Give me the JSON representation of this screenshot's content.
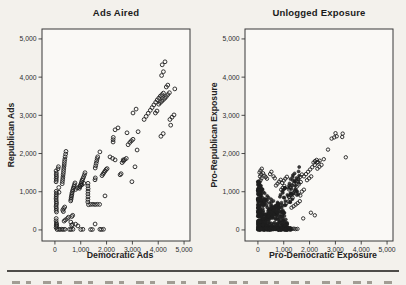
{
  "page": {
    "background": "#f3f1ec"
  },
  "chart_data": [
    {
      "type": "scatter",
      "title": "Ads Aired",
      "xlabel": "Democratic Ads",
      "ylabel": "Republican Ads",
      "xlim": [
        -500,
        5230
      ],
      "ylim": [
        -290,
        5260
      ],
      "xticks": {
        "values": [
          0,
          1000,
          2000,
          3000,
          4000,
          5000
        ],
        "labels": [
          "0",
          "1,000",
          "2,000",
          "3,000",
          "4,000",
          "5,000"
        ]
      },
      "yticks": {
        "values": [
          0,
          1000,
          2000,
          3000,
          4000,
          5000
        ],
        "labels": [
          "0",
          "1,000",
          "2,000",
          "3,000",
          "4,000",
          "5,000"
        ]
      },
      "grid": false,
      "legend": null,
      "point_color": "#1f1f1f",
      "frame_color": "#383838",
      "points": [
        [
          45,
          60
        ],
        [
          52,
          120
        ],
        [
          58,
          180
        ],
        [
          46,
          240
        ],
        [
          50,
          300
        ],
        [
          60,
          470
        ],
        [
          50,
          515
        ],
        [
          56,
          560
        ],
        [
          46,
          605
        ],
        [
          50,
          650
        ],
        [
          60,
          695
        ],
        [
          55,
          740
        ],
        [
          50,
          785
        ],
        [
          46,
          830
        ],
        [
          55,
          875
        ],
        [
          50,
          920
        ],
        [
          60,
          965
        ],
        [
          50,
          1010
        ],
        [
          46,
          1260
        ],
        [
          55,
          1305
        ],
        [
          50,
          1350
        ],
        [
          60,
          1395
        ],
        [
          50,
          1440
        ],
        [
          56,
          1485
        ],
        [
          46,
          1545
        ],
        [
          70,
          95
        ],
        [
          65,
          145
        ],
        [
          120,
          1600
        ],
        [
          135,
          1655
        ],
        [
          150,
          1110
        ],
        [
          160,
          985
        ],
        [
          85,
          10
        ],
        [
          145,
          16
        ],
        [
          205,
          10
        ],
        [
          265,
          20
        ],
        [
          325,
          12
        ],
        [
          385,
          16
        ],
        [
          355,
          230
        ],
        [
          405,
          262
        ],
        [
          485,
          300
        ],
        [
          525,
          332
        ],
        [
          645,
          120
        ],
        [
          685,
          142
        ],
        [
          890,
          105
        ],
        [
          300,
          520
        ],
        [
          340,
          560
        ],
        [
          380,
          600
        ],
        [
          330,
          480
        ],
        [
          282,
          1210
        ],
        [
          291,
          1268
        ],
        [
          300,
          1326
        ],
        [
          309,
          1384
        ],
        [
          318,
          1442
        ],
        [
          327,
          1500
        ],
        [
          336,
          1558
        ],
        [
          345,
          1616
        ],
        [
          354,
          1674
        ],
        [
          363,
          1732
        ],
        [
          372,
          1790
        ],
        [
          381,
          1848
        ],
        [
          395,
          1915
        ],
        [
          412,
          1985
        ],
        [
          428,
          2055
        ],
        [
          612,
          760
        ],
        [
          622,
          802
        ],
        [
          632,
          844
        ],
        [
          642,
          886
        ],
        [
          652,
          928
        ],
        [
          663,
          970
        ],
        [
          680,
          1012
        ],
        [
          698,
          1054
        ],
        [
          716,
          1096
        ],
        [
          734,
          1138
        ],
        [
          755,
          1185
        ],
        [
          778,
          1232
        ],
        [
          652,
          352
        ],
        [
          690,
          382
        ],
        [
          615,
          205
        ],
        [
          562,
          14
        ],
        [
          622,
          10
        ],
        [
          702,
          15
        ],
        [
          952,
          1090
        ],
        [
          972,
          1132
        ],
        [
          992,
          1174
        ],
        [
          1012,
          1216
        ],
        [
          1032,
          1258
        ],
        [
          1052,
          1300
        ],
        [
          1082,
          1342
        ],
        [
          1112,
          1388
        ],
        [
          1142,
          1442
        ],
        [
          1165,
          1498
        ],
        [
          1002,
          12
        ],
        [
          1082,
          15
        ],
        [
          800,
          1060
        ],
        [
          880,
          1100
        ],
        [
          960,
          1140
        ],
        [
          1040,
          1180
        ],
        [
          1120,
          1220
        ],
        [
          1272,
          730
        ],
        [
          1278,
          800
        ],
        [
          1282,
          870
        ],
        [
          1276,
          940
        ],
        [
          1280,
          1010
        ],
        [
          1284,
          1080
        ],
        [
          1278,
          1150
        ],
        [
          1282,
          1220
        ],
        [
          1300,
          660
        ],
        [
          1385,
          668
        ],
        [
          1470,
          672
        ],
        [
          1555,
          666
        ],
        [
          1640,
          670
        ],
        [
          1730,
          668
        ],
        [
          1940,
          890
        ],
        [
          1382,
          12
        ],
        [
          1452,
          10
        ],
        [
          1742,
          16
        ],
        [
          1802,
          10
        ],
        [
          1882,
          16
        ],
        [
          800,
          150
        ],
        [
          1555,
          155
        ],
        [
          1552,
          1312
        ],
        [
          1565,
          1362
        ],
        [
          1558,
          1620
        ],
        [
          1578,
          1682
        ],
        [
          1598,
          1744
        ],
        [
          1618,
          1806
        ],
        [
          1638,
          1868
        ],
        [
          1658,
          1915
        ],
        [
          1822,
          1422
        ],
        [
          1862,
          1462
        ],
        [
          1902,
          1502
        ],
        [
          1942,
          1542
        ],
        [
          1982,
          1582
        ],
        [
          2022,
          1605
        ],
        [
          1742,
          2042
        ],
        [
          2132,
          1912
        ],
        [
          2232,
          1872
        ],
        [
          2332,
          1832
        ],
        [
          2602,
          1762
        ],
        [
          2652,
          1802
        ],
        [
          2702,
          1842
        ],
        [
          2762,
          1872
        ],
        [
          2642,
          1832
        ],
        [
          2522,
          1442
        ],
        [
          2562,
          1472
        ],
        [
          3102,
          1652
        ],
        [
          2982,
          1262
        ],
        [
          2252,
          2302
        ],
        [
          2252,
          2362
        ],
        [
          2262,
          2422
        ],
        [
          2332,
          2622
        ],
        [
          2442,
          2672
        ],
        [
          2792,
          2542
        ],
        [
          3222,
          2572
        ],
        [
          2832,
          2232
        ],
        [
          3182,
          2092
        ],
        [
          2902,
          2292
        ],
        [
          2962,
          2332
        ],
        [
          3022,
          2372
        ],
        [
          3022,
          3062
        ],
        [
          3142,
          3162
        ],
        [
          3452,
          2892
        ],
        [
          3532,
          2972
        ],
        [
          3612,
          3052
        ],
        [
          3692,
          3132
        ],
        [
          3762,
          3202
        ],
        [
          3832,
          3272
        ],
        [
          3902,
          3342
        ],
        [
          3962,
          3402
        ],
        [
          4022,
          3452
        ],
        [
          4082,
          3502
        ],
        [
          4142,
          3542
        ],
        [
          4202,
          3582
        ],
        [
          4022,
          3292
        ],
        [
          4082,
          3332
        ],
        [
          4142,
          3372
        ],
        [
          4202,
          3412
        ],
        [
          4262,
          3452
        ],
        [
          3892,
          3062
        ],
        [
          3952,
          3112
        ],
        [
          4312,
          3492
        ],
        [
          4372,
          3542
        ],
        [
          4432,
          3592
        ],
        [
          4312,
          3742
        ],
        [
          4372,
          3792
        ],
        [
          4132,
          4042
        ],
        [
          4642,
          3692
        ],
        [
          4452,
          2892
        ],
        [
          4532,
          2952
        ],
        [
          4612,
          3012
        ],
        [
          4102,
          2452
        ],
        [
          4192,
          2522
        ],
        [
          4482,
          2742
        ],
        [
          4152,
          4322
        ],
        [
          4262,
          4402
        ],
        [
          4202,
          4142
        ]
      ],
      "dense_regions": []
    },
    {
      "type": "scatter",
      "title": "Unlogged Exposure",
      "xlabel": "Pro-Democratic Exposure",
      "ylabel": "Pro-Republican Exposure",
      "xlim": [
        -500,
        5230
      ],
      "ylim": [
        -290,
        5260
      ],
      "xticks": {
        "values": [
          0,
          1000,
          2000,
          3000,
          4000,
          5000
        ],
        "labels": [
          "0",
          "1,000",
          "2,000",
          "3,000",
          "4,000",
          "5,000"
        ]
      },
      "yticks": {
        "values": [
          0,
          1000,
          2000,
          3000,
          4000,
          5000
        ],
        "labels": [
          "0",
          "1,000",
          "2,000",
          "3,000",
          "4,000",
          "5,000"
        ]
      },
      "grid": false,
      "legend": null,
      "point_color": "#1f1f1f",
      "frame_color": "#383838",
      "points": [
        [
          60,
          1250
        ],
        [
          100,
          1300
        ],
        [
          140,
          1352
        ],
        [
          82,
          1402
        ],
        [
          122,
          1452
        ],
        [
          62,
          1502
        ],
        [
          102,
          1552
        ],
        [
          152,
          1602
        ],
        [
          202,
          1482
        ],
        [
          252,
          1422
        ],
        [
          302,
          1382
        ],
        [
          352,
          1342
        ],
        [
          472,
          1462
        ],
        [
          522,
          1522
        ],
        [
          602,
          1402
        ],
        [
          652,
          1352
        ],
        [
          702,
          1162
        ],
        [
          762,
          1212
        ],
        [
          822,
          1262
        ],
        [
          882,
          1312
        ],
        [
          942,
          1232
        ],
        [
          1002,
          1292
        ],
        [
          1062,
          1342
        ],
        [
          1122,
          1392
        ],
        [
          902,
          1052
        ],
        [
          962,
          1102
        ],
        [
          1022,
          1152
        ],
        [
          1202,
          1062
        ],
        [
          1262,
          1112
        ],
        [
          1322,
          1162
        ],
        [
          1402,
          1212
        ],
        [
          1482,
          1272
        ],
        [
          1562,
          1332
        ],
        [
          1642,
          1392
        ],
        [
          1702,
          1452
        ],
        [
          1782,
          1402
        ],
        [
          1862,
          1462
        ],
        [
          1942,
          1522
        ],
        [
          2022,
          1582
        ],
        [
          2102,
          1642
        ],
        [
          1502,
          1132
        ],
        [
          1582,
          1192
        ],
        [
          1662,
          1252
        ],
        [
          1202,
          862
        ],
        [
          1282,
          912
        ],
        [
          1362,
          962
        ],
        [
          1442,
          1012
        ],
        [
          2202,
          1702
        ],
        [
          2282,
          1762
        ],
        [
          2152,
          1762
        ],
        [
          2212,
          1802
        ],
        [
          2272,
          1832
        ],
        [
          2332,
          1772
        ],
        [
          2392,
          1812
        ],
        [
          2552,
          1852
        ],
        [
          2712,
          2102
        ],
        [
          2852,
          2392
        ],
        [
          2952,
          2422
        ],
        [
          3052,
          2452
        ],
        [
          3002,
          2532
        ],
        [
          3402,
          1902
        ],
        [
          3262,
          2432
        ],
        [
          3282,
          2522
        ],
        [
          2302,
          1602
        ],
        [
          2382,
          1652
        ],
        [
          2462,
          1702
        ],
        [
          1902,
          1302
        ],
        [
          1982,
          1352
        ],
        [
          2062,
          1402
        ],
        [
          1702,
          1002
        ],
        [
          1782,
          1052
        ],
        [
          1642,
          902
        ],
        [
          1102,
          702
        ],
        [
          1182,
          742
        ],
        [
          1262,
          792
        ],
        [
          1342,
          842
        ],
        [
          2052,
          452
        ],
        [
          2202,
          382
        ],
        [
          1752,
          302
        ],
        [
          1302,
          582
        ],
        [
          1382,
          622
        ],
        [
          1462,
          662
        ],
        [
          1542,
          702
        ],
        [
          1622,
          752
        ],
        [
          1252,
          30
        ],
        [
          1322,
          26
        ],
        [
          1392,
          32
        ],
        [
          1462,
          22
        ],
        [
          1532,
          28
        ]
      ],
      "dense_regions": [
        {
          "type": "wedge",
          "count": 320,
          "xmax": 1150,
          "xpow": 1.9,
          "ybase": 1280,
          "yslope": 0.78,
          "ypow": 1.7,
          "ymin": 130
        },
        {
          "type": "strip",
          "count": 85,
          "x0": 0,
          "x1": 1280,
          "y0": 0,
          "y1": 65
        },
        {
          "type": "strip",
          "count": 60,
          "x0": 0,
          "x1": 130,
          "y0": 0,
          "y1": 1260
        },
        {
          "type": "band",
          "count": 95,
          "x0": 160,
          "x1": 1600,
          "slope": 0.82,
          "spread": 0.5
        }
      ]
    }
  ]
}
